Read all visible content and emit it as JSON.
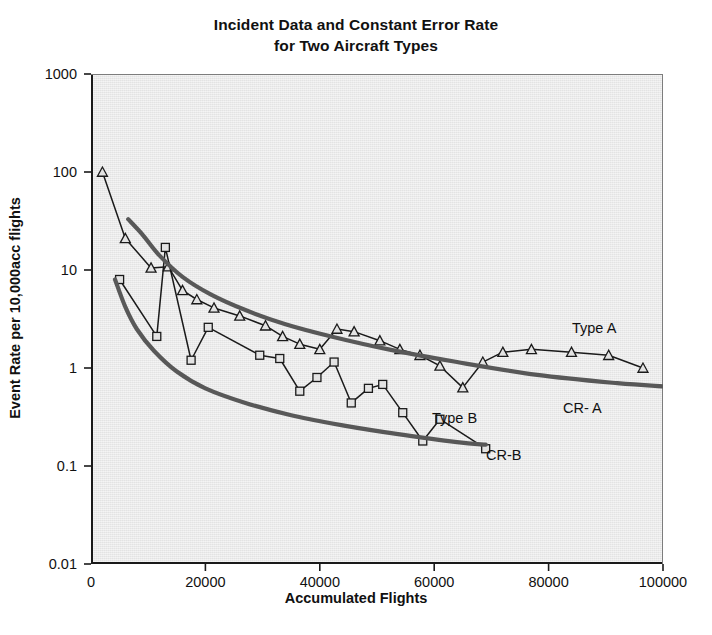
{
  "chart_data": {
    "type": "line",
    "title": "Incident Data and Constant Error Rate for Two Aircraft Types",
    "title_line1": "Incident Data and Constant Error Rate",
    "title_line2": "for Two Aircraft Types",
    "xlabel": "Accumulated Flights",
    "ylabel": "Event Rate per 10,000acc flights",
    "xlim": [
      0,
      100000
    ],
    "ylim": [
      0.01,
      1000
    ],
    "yscale": "log",
    "xscale": "linear",
    "grid": false,
    "legend_position": "inline-annotations",
    "xticks": [
      "0",
      "20000",
      "40000",
      "60000",
      "80000",
      "100000"
    ],
    "xtick_values": [
      0,
      20000,
      40000,
      60000,
      80000,
      100000
    ],
    "yticks": [
      "1000",
      "100",
      "10",
      "1",
      "0.1",
      "0.01"
    ],
    "ytick_values": [
      1000,
      100,
      10,
      1,
      0.1,
      0.01
    ],
    "plot_bgcolor": "#e3e3e3",
    "series": [
      {
        "name": "Type A",
        "marker": "triangle",
        "color": "#1a1a1a",
        "x": [
          2000,
          6000,
          10500,
          13500,
          16000,
          18500,
          21500,
          26000,
          30500,
          33500,
          36500,
          40000,
          43000,
          46000,
          50500,
          54000,
          57500,
          61000,
          65000,
          68500,
          72000,
          77000,
          84000,
          90500,
          96500
        ],
        "y": [
          100,
          21,
          10.5,
          10.8,
          6.2,
          5.0,
          4.1,
          3.4,
          2.7,
          2.1,
          1.75,
          1.55,
          2.5,
          2.35,
          1.9,
          1.55,
          1.35,
          1.05,
          0.63,
          1.15,
          1.45,
          1.55,
          1.45,
          1.35,
          1.0
        ]
      },
      {
        "name": "Type B",
        "marker": "square",
        "color": "#1a1a1a",
        "x": [
          5000,
          11500,
          13000,
          17500,
          20500,
          29500,
          33000,
          36500,
          39500,
          42500,
          45500,
          48500,
          51000,
          54500,
          58000,
          61000,
          69000
        ],
        "y": [
          8.0,
          2.1,
          17.0,
          1.2,
          2.6,
          1.35,
          1.25,
          0.58,
          0.8,
          1.15,
          0.44,
          0.62,
          0.68,
          0.35,
          0.18,
          0.3,
          0.15
        ]
      },
      {
        "name": "CR- A",
        "marker": "none",
        "style": "thick-smooth",
        "color": "#585858",
        "x": [
          6500,
          9000,
          12000,
          16000,
          21000,
          27000,
          34000,
          42000,
          52000,
          64000,
          78000,
          92000,
          100000
        ],
        "y": [
          33,
          23,
          14,
          8.5,
          5.6,
          3.9,
          2.8,
          2.1,
          1.55,
          1.15,
          0.85,
          0.7,
          0.65
        ]
      },
      {
        "name": "CR-B",
        "marker": "none",
        "style": "thick-smooth",
        "color": "#585858",
        "x": [
          4200,
          6000,
          8000,
          11000,
          15000,
          20000,
          27000,
          35000,
          44000,
          54000,
          64000,
          69000
        ],
        "y": [
          8.0,
          4.2,
          2.5,
          1.5,
          0.92,
          0.62,
          0.44,
          0.33,
          0.26,
          0.21,
          0.175,
          0.165
        ]
      }
    ],
    "annotations": [
      {
        "text": "Type A",
        "x_px": 572,
        "y_px": 320
      },
      {
        "text": "CR- A",
        "x_px": 563,
        "y_px": 400
      },
      {
        "text": "Type B",
        "x_px": 432,
        "y_px": 410
      },
      {
        "text": "CR-B",
        "x_px": 486,
        "y_px": 447
      }
    ]
  }
}
